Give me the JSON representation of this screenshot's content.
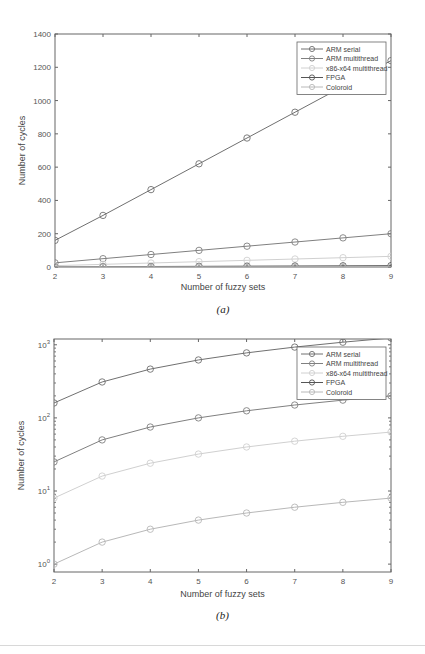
{
  "chart_data": [
    {
      "type": "line",
      "caption": "(a)",
      "title": "",
      "xlabel": "Number of fuzzy sets",
      "ylabel": "Number of cycles",
      "x": [
        2,
        3,
        4,
        5,
        6,
        7,
        8,
        9
      ],
      "xlim": [
        2,
        9
      ],
      "ylim": [
        0,
        1400
      ],
      "yscale": "linear",
      "yticks": [
        0,
        200,
        400,
        600,
        800,
        1000,
        1200,
        1400
      ],
      "ytick_labels": [
        "0",
        "200",
        "400",
        "600",
        "800",
        "1000",
        "1200",
        "1400"
      ],
      "xtick_labels": [
        "2",
        "3",
        "4",
        "5",
        "6",
        "7",
        "8",
        "9"
      ],
      "grid": false,
      "legend_position": "upper right",
      "series": [
        {
          "name": "ARM serial",
          "color": "#707070",
          "values": [
            160,
            310,
            465,
            620,
            775,
            930,
            1085,
            1240
          ]
        },
        {
          "name": "ARM multithread",
          "color": "#808080",
          "values": [
            25,
            50,
            75,
            100,
            125,
            150,
            175,
            200
          ]
        },
        {
          "name": "x86-x64 multithread",
          "color": "#d0d0d0",
          "values": [
            8,
            16,
            24,
            32,
            40,
            48,
            56,
            64
          ]
        },
        {
          "name": "FPGA",
          "color": "#555555",
          "values": [
            1,
            2,
            3,
            4,
            5,
            6,
            7,
            8
          ]
        },
        {
          "name": "Coloroid",
          "color": "#b8b8b8",
          "values": [
            0.5,
            0.5,
            0.5,
            0.5,
            0.5,
            0.5,
            0.5,
            0.5
          ]
        }
      ]
    },
    {
      "type": "line",
      "caption": "(b)",
      "title": "",
      "xlabel": "Number of fuzzy sets",
      "ylabel": "Number of cycles",
      "x": [
        2,
        3,
        4,
        5,
        6,
        7,
        8,
        9
      ],
      "xlim": [
        2,
        9
      ],
      "ylim": [
        0.78,
        1200
      ],
      "yscale": "log",
      "yticks": [
        1,
        10,
        100,
        1000
      ],
      "ytick_labels": [
        "10^0",
        "10^1",
        "10^2",
        "10^3"
      ],
      "xtick_labels": [
        "2",
        "3",
        "4",
        "5",
        "6",
        "7",
        "8",
        "9"
      ],
      "grid": false,
      "legend_position": "upper right",
      "series": [
        {
          "name": "ARM serial",
          "color": "#707070",
          "values": [
            160,
            310,
            465,
            620,
            775,
            930,
            1085,
            1240
          ]
        },
        {
          "name": "ARM multithread",
          "color": "#808080",
          "values": [
            25,
            50,
            75,
            100,
            125,
            150,
            175,
            200
          ]
        },
        {
          "name": "x86-x64 multithread",
          "color": "#d0d0d0",
          "values": [
            8,
            16,
            24,
            32,
            40,
            48,
            56,
            64
          ]
        },
        {
          "name": "FPGA",
          "color": "#555555",
          "values": [
            0.5,
            0.5,
            0.5,
            0.5,
            0.5,
            0.5,
            0.5,
            0.5
          ]
        },
        {
          "name": "Coloroid",
          "color": "#b8b8b8",
          "values": [
            1,
            2,
            3,
            4,
            5,
            6,
            7,
            8
          ]
        }
      ]
    }
  ]
}
